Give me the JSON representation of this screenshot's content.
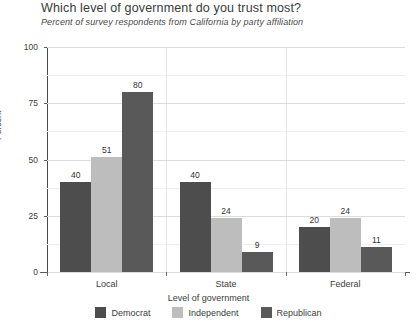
{
  "chart_data": {
    "type": "bar",
    "title": "Which level of government do you trust most?",
    "subtitle": "Percent of survey respondents from California by party affiliation",
    "xlabel": "Level of government",
    "ylabel": "Percent",
    "categories": [
      "Local",
      "State",
      "Federal"
    ],
    "series": [
      {
        "name": "Democrat",
        "color": "#4d4d4d",
        "values": [
          40,
          40,
          20
        ]
      },
      {
        "name": "Independent",
        "color": "#bdbdbd",
        "values": [
          51,
          24,
          24
        ]
      },
      {
        "name": "Republican",
        "color": "#595959",
        "values": [
          80,
          9,
          11
        ]
      }
    ],
    "ylim": [
      0,
      100
    ],
    "yticks": [
      0,
      25,
      50,
      75,
      100
    ],
    "ytick_labels": [
      "0",
      "25",
      "50",
      "75",
      "100"
    ],
    "grid": "horizontal-and-vertical-category-separators",
    "legend_position": "bottom-center",
    "value_labels": true
  }
}
